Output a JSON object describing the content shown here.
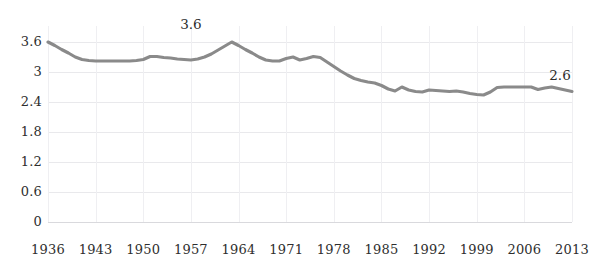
{
  "chart_data": {
    "type": "line",
    "title": "",
    "subtitle": "",
    "xlabel": "",
    "ylabel": "",
    "grid": true,
    "legend": "none",
    "xlim": [
      1936,
      2013
    ],
    "ylim": [
      0,
      3.6
    ],
    "y_ticks": [
      "0",
      "0.6",
      "1.2",
      "1.8",
      "2.4",
      "3",
      "3.6"
    ],
    "y_tick_values": [
      0,
      0.6,
      1.2,
      1.8,
      2.4,
      3,
      3.6
    ],
    "x_ticks": [
      "1936",
      "1943",
      "1950",
      "1957",
      "1964",
      "1971",
      "1978",
      "1985",
      "1992",
      "1999",
      "2006",
      "2013"
    ],
    "x_tick_values": [
      1936,
      1943,
      1950,
      1957,
      1964,
      1971,
      1978,
      1985,
      1992,
      1999,
      2006,
      2013
    ],
    "annotations": [
      {
        "text": "3.6",
        "x": 1957,
        "y": 3.6
      },
      {
        "text": "2.6",
        "x": 2013,
        "y": 2.6
      }
    ],
    "series": [
      {
        "name": "Fertility rate",
        "color": "#8a8a8a",
        "x": [
          1936,
          1937,
          1938,
          1939,
          1940,
          1941,
          1942,
          1943,
          1944,
          1945,
          1946,
          1947,
          1948,
          1949,
          1950,
          1951,
          1952,
          1953,
          1954,
          1955,
          1956,
          1957,
          1958,
          1959,
          1960,
          1961,
          1962,
          1963,
          1964,
          1965,
          1966,
          1967,
          1968,
          1969,
          1970,
          1971,
          1972,
          1973,
          1974,
          1975,
          1976,
          1977,
          1978,
          1979,
          1980,
          1981,
          1982,
          1983,
          1984,
          1985,
          1986,
          1987,
          1988,
          1989,
          1990,
          1991,
          1992,
          1993,
          1994,
          1995,
          1996,
          1997,
          1998,
          1999,
          2000,
          2001,
          2002,
          2003,
          2004,
          2005,
          2006,
          2007,
          2008,
          2009,
          2010,
          2011,
          2012,
          2013
        ],
        "y": [
          3.6,
          3.53,
          3.45,
          3.38,
          3.3,
          3.25,
          3.23,
          3.22,
          3.22,
          3.22,
          3.22,
          3.22,
          3.22,
          3.23,
          3.25,
          3.31,
          3.31,
          3.29,
          3.28,
          3.26,
          3.25,
          3.24,
          3.26,
          3.3,
          3.36,
          3.44,
          3.52,
          3.6,
          3.53,
          3.45,
          3.38,
          3.3,
          3.24,
          3.22,
          3.22,
          3.27,
          3.3,
          3.24,
          3.27,
          3.31,
          3.29,
          3.2,
          3.11,
          3.02,
          2.94,
          2.87,
          2.83,
          2.8,
          2.78,
          2.73,
          2.66,
          2.62,
          2.7,
          2.64,
          2.61,
          2.6,
          2.64,
          2.63,
          2.62,
          2.61,
          2.62,
          2.6,
          2.57,
          2.55,
          2.54,
          2.6,
          2.69,
          2.7,
          2.7,
          2.7,
          2.7,
          2.7,
          2.65,
          2.68,
          2.7,
          2.67,
          2.64,
          2.61
        ],
        "start_value": 3.6,
        "peak_value": 3.6,
        "end_value": 2.6
      }
    ]
  },
  "axes": {
    "y_label_color": "#2e2e2e",
    "x_label_color": "#2e2e2e",
    "gridline_color": "#e9e9ec",
    "line_color": "#8a8a8a"
  }
}
